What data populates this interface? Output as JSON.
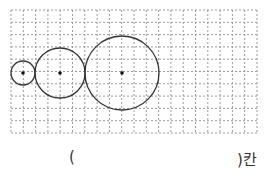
{
  "figure": {
    "grid": {
      "x": 11,
      "y": 10,
      "cell": 12.3,
      "cols": 20,
      "rows": 10,
      "line_color": "#9a9a9a"
    },
    "circles": [
      {
        "id": "small",
        "cx": 23,
        "cy": 73,
        "r": 12
      },
      {
        "id": "medium",
        "cx": 60,
        "cy": 73,
        "r": 25
      },
      {
        "id": "large",
        "cx": 122,
        "cy": 73,
        "r": 37
      }
    ],
    "stroke_color": "#333333"
  },
  "answer": {
    "open": "(",
    "close": ")칸"
  }
}
